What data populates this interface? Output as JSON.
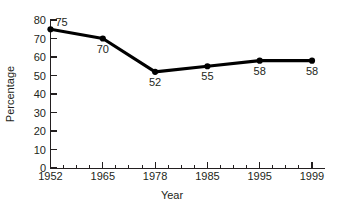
{
  "chart_data": {
    "type": "line",
    "title": "",
    "xlabel": "Year",
    "ylabel": "Percentage",
    "categories": [
      "1952",
      "1965",
      "1978",
      "1985",
      "1995",
      "1999"
    ],
    "x": [
      1952,
      1965,
      1978,
      1985,
      1995,
      1999
    ],
    "values": [
      75,
      70,
      52,
      55,
      58,
      58
    ],
    "point_labels": [
      "75",
      "70",
      "52",
      "55",
      "58",
      "58"
    ],
    "ylim": [
      0,
      80
    ],
    "ytick_labels": [
      "0",
      "10",
      "20",
      "30",
      "40",
      "50",
      "60",
      "70",
      "80"
    ],
    "ytick_values": [
      0,
      10,
      20,
      30,
      40,
      50,
      60,
      70,
      80
    ],
    "xtick_labels": [
      "1952",
      "1965",
      "1978",
      "1985",
      "1995",
      "1999"
    ],
    "grid": false,
    "legend": false,
    "legend_position": "none",
    "series": [
      {
        "name": "Percentage",
        "values": [
          75,
          70,
          52,
          55,
          58,
          58
        ]
      }
    ],
    "colors": {
      "line": "#000000",
      "marker": "#000000",
      "axis": "#231f20",
      "background": "#ffffff"
    }
  }
}
